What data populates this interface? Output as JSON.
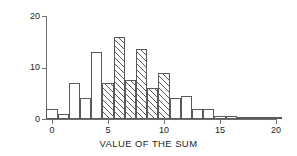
{
  "chart_data": {
    "type": "bar",
    "title": "",
    "xlabel": "VALUE OF THE SUM",
    "ylabel": "",
    "xlim": [
      0,
      20
    ],
    "ylim": [
      0,
      20
    ],
    "grid": false,
    "legend": "none",
    "bin_width": 1,
    "x_ticks": [
      {
        "value": 0,
        "label": "0"
      },
      {
        "value": 5,
        "label": "5"
      },
      {
        "value": 10,
        "label": "10"
      },
      {
        "value": 15,
        "label": "15"
      },
      {
        "value": 20,
        "label": "20"
      }
    ],
    "y_ticks": [
      {
        "value": 0,
        "label": "0"
      },
      {
        "value": 10,
        "label": "10"
      },
      {
        "value": 20,
        "label": "20"
      }
    ],
    "bars": [
      {
        "bin_start": -0.5,
        "bin_end": 0.5,
        "value": 2,
        "hatched": false
      },
      {
        "bin_start": 0.5,
        "bin_end": 1.5,
        "value": 1,
        "hatched": false
      },
      {
        "bin_start": 1.5,
        "bin_end": 2.5,
        "value": 7,
        "hatched": false
      },
      {
        "bin_start": 2.5,
        "bin_end": 3.5,
        "value": 4,
        "hatched": false
      },
      {
        "bin_start": 3.5,
        "bin_end": 4.5,
        "value": 13,
        "hatched": false
      },
      {
        "bin_start": 4.5,
        "bin_end": 5.5,
        "value": 7,
        "hatched": true
      },
      {
        "bin_start": 5.5,
        "bin_end": 6.5,
        "value": 16,
        "hatched": true
      },
      {
        "bin_start": 6.5,
        "bin_end": 7.5,
        "value": 7.5,
        "hatched": true
      },
      {
        "bin_start": 7.5,
        "bin_end": 8.5,
        "value": 13.5,
        "hatched": true
      },
      {
        "bin_start": 8.5,
        "bin_end": 9.5,
        "value": 6,
        "hatched": true
      },
      {
        "bin_start": 9.5,
        "bin_end": 10.5,
        "value": 9,
        "hatched": true
      },
      {
        "bin_start": 10.5,
        "bin_end": 11.5,
        "value": 4,
        "hatched": false
      },
      {
        "bin_start": 11.5,
        "bin_end": 12.5,
        "value": 4.5,
        "hatched": false
      },
      {
        "bin_start": 12.5,
        "bin_end": 13.5,
        "value": 2,
        "hatched": false
      },
      {
        "bin_start": 13.5,
        "bin_end": 14.5,
        "value": 2,
        "hatched": false
      },
      {
        "bin_start": 14.5,
        "bin_end": 15.5,
        "value": 0.6,
        "hatched": false
      },
      {
        "bin_start": 15.5,
        "bin_end": 16.5,
        "value": 0.6,
        "hatched": false
      },
      {
        "bin_start": 16.5,
        "bin_end": 17.5,
        "value": 0.2,
        "hatched": false
      },
      {
        "bin_start": 17.5,
        "bin_end": 18.5,
        "value": 0.15,
        "hatched": false
      },
      {
        "bin_start": 18.5,
        "bin_end": 19.5,
        "value": 0.1,
        "hatched": false
      },
      {
        "bin_start": 19.5,
        "bin_end": 20.5,
        "value": 0.1,
        "hatched": false
      }
    ],
    "colors": {
      "axis": "#6f6f6f",
      "bar_outline": "#5a5a5a",
      "bar_fill": "#ffffff",
      "hatch": "#5a5a5a",
      "text": "#1c1c1c",
      "background": "#ffffff"
    }
  }
}
